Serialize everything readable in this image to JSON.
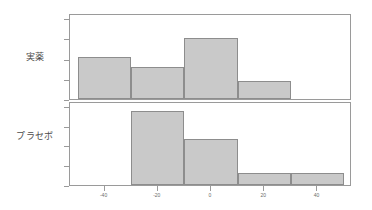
{
  "chart_data": {
    "type": "bar",
    "title": "",
    "subtitle": "",
    "xlabel": "",
    "ylabel": "",
    "layout": "two stacked panels (trellis histogram)",
    "grid": false,
    "legend": "none",
    "bar_fill_color": "#c9c9c9",
    "bar_border_color": "#8d8d8d",
    "panel_border_color": "#9a9a9a",
    "axis_color": "#9a9a9a",
    "xlim": [
      -53,
      53
    ],
    "ylim": [
      0,
      10
    ],
    "bin_width": 20,
    "bin_edges": [
      -50,
      -30,
      -10,
      10,
      30,
      50
    ],
    "xticks": [
      {
        "value": "-40",
        "pos": -40
      },
      {
        "value": "-20",
        "pos": -20
      },
      {
        "value": "0",
        "pos": 0
      },
      {
        "value": "20",
        "pos": 20
      },
      {
        "value": "40",
        "pos": 40
      }
    ],
    "yticks": [
      "0",
      "2",
      "4",
      "6",
      "8"
    ],
    "panels": [
      {
        "id": "active",
        "strip_label": "実薬",
        "bars": [
          {
            "bin": "-50 to -30",
            "value": 5.0
          },
          {
            "bin": "-30 to -10",
            "value": 3.8
          },
          {
            "bin": "-10 to 10",
            "value": 7.3
          },
          {
            "bin": "10 to 30",
            "value": 2.1
          },
          {
            "bin": "30 to 50",
            "value": 0.0
          }
        ]
      },
      {
        "id": "placebo",
        "strip_label": "プラセボ",
        "bars": [
          {
            "bin": "-50 to -30",
            "value": 0.0
          },
          {
            "bin": "-30 to -10",
            "value": 9.0
          },
          {
            "bin": "-10 to 10",
            "value": 5.6
          },
          {
            "bin": "10 to 30",
            "value": 1.5
          },
          {
            "bin": "30 to 50",
            "value": 1.5
          }
        ]
      }
    ]
  }
}
